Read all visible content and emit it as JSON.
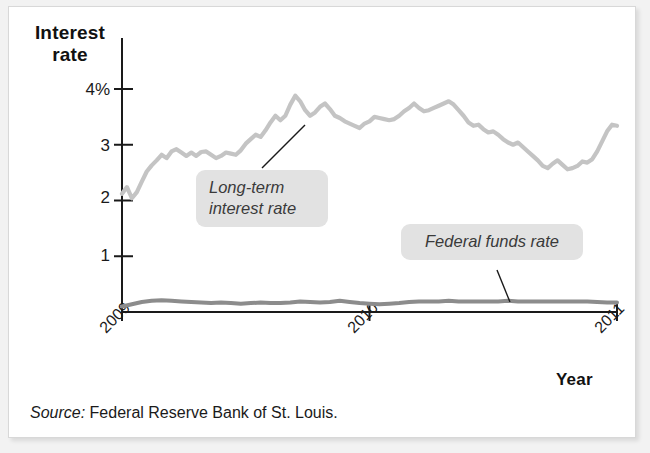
{
  "figure": {
    "y_axis_title": "Interest\nrate",
    "y_axis_title_line1": "Interest",
    "y_axis_title_line2": "rate",
    "x_axis_title": "Year",
    "source_label": "Source:",
    "source_text": " Federal Reserve Bank of St. Louis.",
    "annotations": {
      "long_term_label_line1": "Long-term",
      "long_term_label_line2": "interest rate",
      "federal_funds_label": "Federal funds rate"
    },
    "colors": {
      "long_term_line": "#c4c4c4",
      "federal_funds_line": "#8c8c8c",
      "axis": "#1a1a1a",
      "callout_background": "#e2e2e2",
      "callout_text": "#3a3a3a",
      "page_background": "#ffffff",
      "frame_border": "#d8d8d8"
    }
  },
  "chart_data": {
    "type": "line",
    "title": "",
    "subtitle": "",
    "xlabel": "Year",
    "ylabel": "Interest rate",
    "ylim": [
      0,
      4.4
    ],
    "xlim": [
      2009.0,
      2011.0
    ],
    "grid": false,
    "legend_position": "inline-annotations",
    "ytick_labels": [
      "4%",
      "3",
      "2",
      "1"
    ],
    "ytick_values": [
      4,
      3,
      2,
      1
    ],
    "xtick_labels": [
      "2009",
      "2010",
      "2011"
    ],
    "xtick_values": [
      2009,
      2010,
      2011
    ],
    "annotations": [
      {
        "text": "Long-term interest rate",
        "points_to_series": "Long-term interest rate",
        "x": 2009.85,
        "y": 3.2
      },
      {
        "text": "Federal funds rate",
        "points_to_series": "Federal funds rate",
        "x": 2010.72,
        "y": 0.16
      }
    ],
    "series": [
      {
        "name": "Long-term interest rate",
        "color": "#c4c4c4",
        "x": [
          2009.0,
          2009.02,
          2009.04,
          2009.06,
          2009.08,
          2009.1,
          2009.12,
          2009.14,
          2009.16,
          2009.18,
          2009.2,
          2009.22,
          2009.24,
          2009.26,
          2009.28,
          2009.3,
          2009.32,
          2009.34,
          2009.36,
          2009.38,
          2009.4,
          2009.42,
          2009.44,
          2009.46,
          2009.48,
          2009.5,
          2009.52,
          2009.54,
          2009.56,
          2009.58,
          2009.6,
          2009.62,
          2009.64,
          2009.66,
          2009.68,
          2009.7,
          2009.72,
          2009.74,
          2009.76,
          2009.78,
          2009.8,
          2009.82,
          2009.84,
          2009.86,
          2009.88,
          2009.9,
          2009.92,
          2009.94,
          2009.96,
          2009.98,
          2010.0,
          2010.02,
          2010.04,
          2010.06,
          2010.08,
          2010.1,
          2010.12,
          2010.14,
          2010.16,
          2010.18,
          2010.2,
          2010.22,
          2010.24,
          2010.26,
          2010.28,
          2010.3,
          2010.32,
          2010.34,
          2010.36,
          2010.38,
          2010.4,
          2010.42,
          2010.44,
          2010.46,
          2010.48,
          2010.5,
          2010.52,
          2010.54,
          2010.56,
          2010.58,
          2010.6,
          2010.62,
          2010.64,
          2010.66,
          2010.68,
          2010.7,
          2010.72,
          2010.74,
          2010.76,
          2010.78,
          2010.8,
          2010.82,
          2010.84,
          2010.86,
          2010.88,
          2010.9,
          2010.92,
          2010.94,
          2010.96,
          2010.98,
          2011.0
        ],
        "y": [
          2.12,
          2.24,
          2.04,
          2.15,
          2.34,
          2.52,
          2.63,
          2.72,
          2.82,
          2.76,
          2.88,
          2.92,
          2.86,
          2.8,
          2.86,
          2.8,
          2.87,
          2.88,
          2.82,
          2.76,
          2.8,
          2.86,
          2.84,
          2.82,
          2.9,
          3.02,
          3.1,
          3.18,
          3.14,
          3.26,
          3.4,
          3.52,
          3.44,
          3.52,
          3.72,
          3.88,
          3.78,
          3.62,
          3.52,
          3.58,
          3.68,
          3.74,
          3.64,
          3.52,
          3.48,
          3.42,
          3.38,
          3.34,
          3.3,
          3.38,
          3.42,
          3.5,
          3.48,
          3.46,
          3.44,
          3.46,
          3.52,
          3.6,
          3.66,
          3.74,
          3.66,
          3.6,
          3.62,
          3.66,
          3.7,
          3.74,
          3.78,
          3.72,
          3.62,
          3.52,
          3.4,
          3.34,
          3.36,
          3.28,
          3.22,
          3.24,
          3.18,
          3.1,
          3.04,
          3.0,
          3.04,
          2.96,
          2.88,
          2.8,
          2.72,
          2.62,
          2.58,
          2.66,
          2.72,
          2.64,
          2.56,
          2.58,
          2.62,
          2.7,
          2.68,
          2.74,
          2.88,
          3.06,
          3.24,
          3.36,
          3.34
        ]
      },
      {
        "name": "Federal funds rate",
        "color": "#8c8c8c",
        "x": [
          2009.0,
          2009.04,
          2009.08,
          2009.12,
          2009.16,
          2009.2,
          2009.24,
          2009.28,
          2009.32,
          2009.36,
          2009.4,
          2009.44,
          2009.48,
          2009.52,
          2009.56,
          2009.6,
          2009.64,
          2009.68,
          2009.72,
          2009.76,
          2009.8,
          2009.84,
          2009.88,
          2009.92,
          2009.96,
          2010.0,
          2010.04,
          2010.08,
          2010.12,
          2010.16,
          2010.2,
          2010.24,
          2010.28,
          2010.32,
          2010.36,
          2010.4,
          2010.44,
          2010.48,
          2010.52,
          2010.56,
          2010.6,
          2010.64,
          2010.68,
          2010.72,
          2010.76,
          2010.8,
          2010.84,
          2010.88,
          2010.92,
          2010.96,
          2011.0
        ],
        "y": [
          0.1,
          0.14,
          0.18,
          0.2,
          0.21,
          0.2,
          0.19,
          0.18,
          0.17,
          0.16,
          0.17,
          0.16,
          0.15,
          0.16,
          0.17,
          0.16,
          0.16,
          0.17,
          0.19,
          0.18,
          0.17,
          0.18,
          0.2,
          0.18,
          0.16,
          0.15,
          0.14,
          0.15,
          0.16,
          0.18,
          0.19,
          0.19,
          0.19,
          0.2,
          0.19,
          0.19,
          0.19,
          0.19,
          0.19,
          0.2,
          0.19,
          0.19,
          0.19,
          0.19,
          0.19,
          0.19,
          0.19,
          0.19,
          0.18,
          0.17,
          0.17
        ]
      }
    ]
  }
}
